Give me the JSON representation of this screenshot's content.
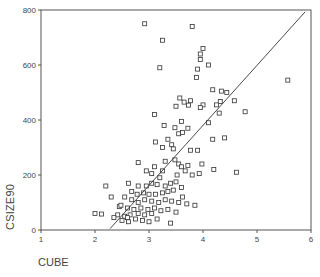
{
  "chart_data": {
    "type": "scatter",
    "title": "",
    "xlabel": "CUBE",
    "ylabel": "CSIZE90",
    "xlim": [
      1,
      6
    ],
    "ylim": [
      0,
      800
    ],
    "xticks": [
      1,
      2,
      3,
      4,
      5,
      6
    ],
    "yticks": [
      0,
      200,
      400,
      600,
      800
    ],
    "grid": false,
    "legend": null,
    "marker": "open-square",
    "fit_line": {
      "type": "linear",
      "x": [
        2.28,
        5.89
      ],
      "y": [
        5,
        793
      ]
    },
    "points": [
      [
        2.92,
        750
      ],
      [
        3.8,
        740
      ],
      [
        3.25,
        690
      ],
      [
        4.0,
        660
      ],
      [
        3.95,
        640
      ],
      [
        3.95,
        620
      ],
      [
        4.1,
        600
      ],
      [
        3.2,
        590
      ],
      [
        3.9,
        585
      ],
      [
        3.88,
        555
      ],
      [
        4.18,
        510
      ],
      [
        4.34,
        505
      ],
      [
        4.44,
        500
      ],
      [
        4.58,
        470
      ],
      [
        4.32,
        467
      ],
      [
        5.57,
        545
      ],
      [
        3.57,
        480
      ],
      [
        3.65,
        465
      ],
      [
        3.5,
        450
      ],
      [
        3.77,
        470
      ],
      [
        3.73,
        454
      ],
      [
        4.0,
        455
      ],
      [
        3.95,
        445
      ],
      [
        4.25,
        455
      ],
      [
        4.3,
        425
      ],
      [
        4.78,
        430
      ],
      [
        4.1,
        390
      ],
      [
        4.18,
        330
      ],
      [
        3.1,
        420
      ],
      [
        3.6,
        395
      ],
      [
        3.55,
        350
      ],
      [
        3.28,
        380
      ],
      [
        3.48,
        372
      ],
      [
        3.72,
        370
      ],
      [
        3.62,
        355
      ],
      [
        3.77,
        290
      ],
      [
        3.42,
        310
      ],
      [
        3.25,
        300
      ],
      [
        3.9,
        290
      ],
      [
        3.93,
        205
      ],
      [
        3.98,
        240
      ],
      [
        4.4,
        335
      ],
      [
        4.62,
        210
      ],
      [
        4.2,
        220
      ],
      [
        2.8,
        245
      ],
      [
        3.1,
        230
      ],
      [
        3.12,
        320
      ],
      [
        3.35,
        330
      ],
      [
        3.45,
        295
      ],
      [
        3.48,
        255
      ],
      [
        3.3,
        250
      ],
      [
        3.55,
        240
      ],
      [
        3.6,
        230
      ],
      [
        3.52,
        200
      ],
      [
        3.72,
        235
      ],
      [
        3.67,
        215
      ],
      [
        3.8,
        200
      ],
      [
        3.25,
        215
      ],
      [
        3.2,
        190
      ],
      [
        3.05,
        205
      ],
      [
        2.95,
        215
      ],
      [
        2.62,
        170
      ],
      [
        2.8,
        160
      ],
      [
        2.95,
        160
      ],
      [
        3.05,
        170
      ],
      [
        3.15,
        165
      ],
      [
        3.3,
        160
      ],
      [
        3.4,
        170
      ],
      [
        3.5,
        175
      ],
      [
        3.6,
        155
      ],
      [
        3.45,
        145
      ],
      [
        3.35,
        140
      ],
      [
        3.25,
        135
      ],
      [
        3.12,
        130
      ],
      [
        3.0,
        130
      ],
      [
        2.9,
        135
      ],
      [
        2.78,
        130
      ],
      [
        2.68,
        140
      ],
      [
        2.55,
        120
      ],
      [
        2.68,
        110
      ],
      [
        2.8,
        100
      ],
      [
        2.92,
        110
      ],
      [
        3.05,
        105
      ],
      [
        3.18,
        100
      ],
      [
        3.3,
        110
      ],
      [
        3.42,
        105
      ],
      [
        3.55,
        100
      ],
      [
        3.62,
        120
      ],
      [
        3.7,
        95
      ],
      [
        3.85,
        90
      ],
      [
        2.45,
        85
      ],
      [
        2.6,
        80
      ],
      [
        2.72,
        75
      ],
      [
        2.85,
        80
      ],
      [
        2.98,
        75
      ],
      [
        3.1,
        80
      ],
      [
        3.22,
        70
      ],
      [
        3.35,
        75
      ],
      [
        3.5,
        65
      ],
      [
        3.05,
        60
      ],
      [
        2.92,
        55
      ],
      [
        2.8,
        60
      ],
      [
        2.65,
        55
      ],
      [
        2.55,
        50
      ],
      [
        2.42,
        55
      ],
      [
        2.35,
        45
      ],
      [
        2.5,
        35
      ],
      [
        2.62,
        30
      ],
      [
        2.75,
        40
      ],
      [
        2.88,
        35
      ],
      [
        3.0,
        30
      ],
      [
        3.15,
        40
      ],
      [
        3.4,
        25
      ],
      [
        2.0,
        60
      ],
      [
        2.12,
        58
      ],
      [
        2.6,
        45
      ],
      [
        2.48,
        90
      ],
      [
        2.3,
        120
      ],
      [
        2.2,
        160
      ]
    ]
  },
  "labels": {
    "xlabel": "CUBE",
    "ylabel": "CSIZE90"
  }
}
